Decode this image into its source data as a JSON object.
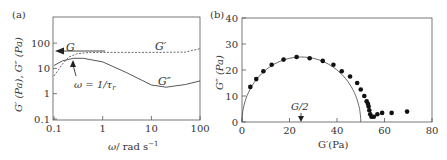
{
  "chart_data": [
    {
      "panel": "(a)",
      "type": "line",
      "xlabel": "ω/ rad s⁻¹",
      "ylabel": "G′ (Pa), G″ (Pa)",
      "xscale": "log",
      "yscale": "log",
      "xlim": [
        0.1,
        100
      ],
      "ylim": [
        0.1,
        1000
      ],
      "xticks": [
        "0.1",
        "1",
        "10",
        "100"
      ],
      "yticks": [
        "0.1",
        "1",
        "10",
        "100"
      ],
      "series": [
        {
          "name": "G′",
          "style": "dashed",
          "x": [
            0.1,
            0.15,
            0.2,
            0.3,
            0.5,
            1,
            10,
            50,
            100
          ],
          "y": [
            5,
            15,
            28,
            38,
            42,
            43,
            43,
            44,
            60
          ]
        },
        {
          "name": "G″",
          "style": "solid",
          "x": [
            0.1,
            0.15,
            0.25,
            0.4,
            1,
            3,
            10,
            20,
            50,
            100
          ],
          "y": [
            13,
            20,
            25,
            25,
            18,
            7,
            2.2,
            1.8,
            2.3,
            3.2
          ]
        }
      ],
      "annotations": [
        {
          "text": "G",
          "desc": "arrow pointing to plateau modulus on y-axis (~42 Pa)"
        },
        {
          "text": "G′"
        },
        {
          "text": "G″"
        },
        {
          "text": "ω = 1/τr",
          "desc": "arrow pointing to crossover at ω≈0.22"
        }
      ],
      "grid": false
    },
    {
      "panel": "(b)",
      "type": "scatter",
      "xlabel": "G′(Pa)",
      "ylabel": "G″ (Pa)",
      "xlim": [
        0,
        80
      ],
      "ylim": [
        0,
        40
      ],
      "xticks": [
        "0",
        "20",
        "40",
        "60",
        "80"
      ],
      "yticks": [
        "0",
        "10",
        "20",
        "30",
        "40"
      ],
      "series": [
        {
          "name": "data",
          "style": "markers",
          "x": [
            3.5,
            6,
            9,
            12.5,
            17.5,
            23,
            28.5,
            34,
            38.5,
            42,
            45.5,
            48.5,
            50,
            51.5,
            52.5,
            53,
            53.3,
            53.6,
            54,
            54.5,
            55.5,
            57,
            59,
            63,
            69.5
          ],
          "y": [
            13.5,
            16.5,
            19.5,
            22,
            24,
            25,
            24.5,
            23.5,
            22,
            19.5,
            17.5,
            15,
            12.5,
            10,
            8,
            7,
            6,
            4.5,
            3,
            2,
            2,
            3,
            3.5,
            3.5,
            4
          ]
        },
        {
          "name": "Maxwell semicircle",
          "style": "solid",
          "center": [
            25,
            0
          ],
          "radius": 25
        }
      ],
      "annotations": [
        {
          "text": "G/2",
          "desc": "arrow pointing down to x=25"
        }
      ],
      "grid": false
    }
  ],
  "labels": {
    "panel_a": "(a)",
    "panel_b": "(b)",
    "a_xlabel": "ω/ rad s",
    "a_xlabel_sup": "−1",
    "a_ylabel": "G′ (Pa), G″ (Pa)",
    "a_G": "G",
    "a_Gp": "G′",
    "a_Gpp": "G″",
    "a_omega": "ω = 1/τ",
    "a_omega_sub": "r",
    "b_xlabel": "G′(Pa)",
    "b_ylabel": "G″ (Pa)",
    "b_g2": "G/2"
  }
}
